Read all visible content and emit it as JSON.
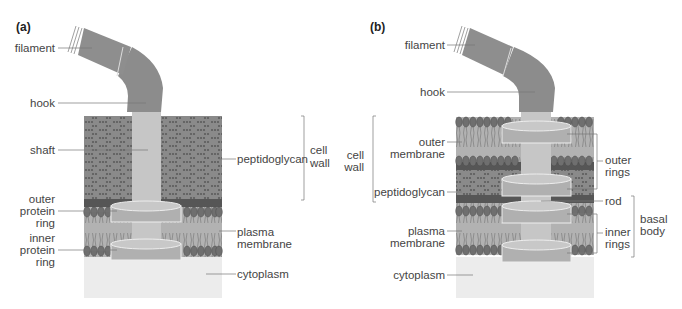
{
  "panels": [
    {
      "tag": "(a)",
      "labels": {
        "filament": "filament",
        "hook": "hook",
        "shaft": "shaft",
        "peptidoglycan": "peptidoglycan",
        "cell_wall_1": "cell",
        "cell_wall_2": "wall",
        "outer_ring_1": "outer",
        "outer_ring_2": "protein",
        "outer_ring_3": "ring",
        "plasma_1": "plasma",
        "plasma_2": "membrane",
        "inner_ring_1": "inner",
        "inner_ring_2": "protein",
        "inner_ring_3": "ring",
        "cytoplasm": "cytoplasm"
      }
    },
    {
      "tag": "(b)",
      "labels": {
        "filament": "filament",
        "hook": "hook",
        "cell_wall_1": "cell",
        "cell_wall_2": "wall",
        "outer_membrane_1": "outer",
        "outer_membrane_2": "membrane",
        "peptidoglycan": "peptidoglycan",
        "plasma_1": "plasma",
        "plasma_2": "membrane",
        "cytoplasm": "cytoplasm",
        "outer_rings_1": "outer",
        "outer_rings_2": "rings",
        "rod": "rod",
        "inner_rings_1": "inner",
        "inner_rings_2": "rings",
        "basal_body_1": "basal",
        "basal_body_2": "body"
      }
    }
  ],
  "colors": {
    "filament": "#8c8c8c",
    "peptidoglycan": "#8a8a8a",
    "peptidoglycan_dark": "#555555",
    "membrane_band": "#a9a9a9",
    "lipid_head": "#6e6e6e",
    "ring": "#b4b4b4",
    "shaft": "#c6c6c6",
    "cytoplasm": "#ececec"
  }
}
